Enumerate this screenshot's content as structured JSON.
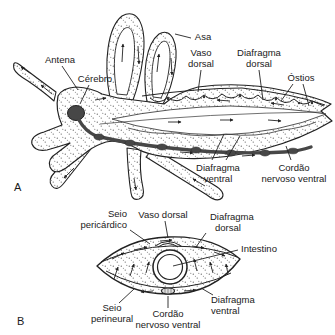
{
  "figure": {
    "colors": {
      "line": "#222222",
      "text": "#1a1a1a",
      "dark_fill": "#474747",
      "stipple": "#5a5a5a",
      "background": "#ffffff"
    },
    "panelA": {
      "panel_label": "A",
      "labels": {
        "antena": "Antena",
        "cerebro": "Cérebro",
        "asa": "Asa",
        "vaso_dorsal_l1": "Vaso",
        "vaso_dorsal_l2": "dorsal",
        "diafragma_dorsal_l1": "Diafragma",
        "diafragma_dorsal_l2": "dorsal",
        "ostios": "Óstios",
        "diafragma_ventral_l1": "Diafragma",
        "diafragma_ventral_l2": "ventral",
        "cordao_l1": "Cordão",
        "cordao_l2": "nervoso ventral"
      }
    },
    "panelB": {
      "panel_label": "B",
      "labels": {
        "seio_pericardico_l1": "Seio",
        "seio_pericardico_l2": "pericárdico",
        "vaso_dorsal": "Vaso dorsal",
        "diafragma_dorsal_l1": "Diafragma",
        "diafragma_dorsal_l2": "dorsal",
        "intestino": "Intestino",
        "seio_perineural_l1": "Seio",
        "seio_perineural_l2": "perineural",
        "cordao_l1": "Cordão",
        "cordao_l2": "nervoso ventral",
        "diafragma_ventral_l1": "Diafragma",
        "diafragma_ventral_l2": "ventral"
      }
    }
  }
}
